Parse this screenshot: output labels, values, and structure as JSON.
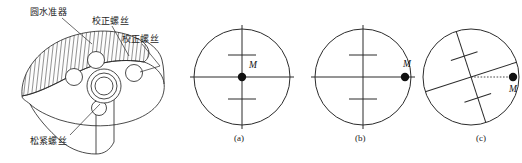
{
  "figure": {
    "background": "#ffffff",
    "stroke": "#2b2b2b"
  },
  "mechanical_drawing": {
    "name": "circular-level-instrument-drawing",
    "callouts": [
      {
        "id": "circular-level",
        "text": "圆水准器",
        "x": 30,
        "y": 7,
        "leader": [
          [
            62,
            18
          ],
          [
            88,
            40
          ]
        ]
      },
      {
        "id": "adjusting-screw-top",
        "text": "校正螺丝",
        "x": 92,
        "y": 15,
        "leader": [
          [
            110,
            26
          ],
          [
            128,
            57
          ]
        ]
      },
      {
        "id": "adjusting-screw-right",
        "text": "校正螺丝",
        "x": 122,
        "y": 33,
        "leader": [
          [
            140,
            44
          ],
          [
            160,
            64
          ]
        ]
      },
      {
        "id": "clamp-screw",
        "text": "松紧螺丝",
        "x": 32,
        "y": 136,
        "leader": [
          [
            68,
            136
          ],
          [
            96,
            104
          ]
        ]
      }
    ]
  },
  "diagrams": [
    {
      "id": "diagram-a",
      "caption": "(a)",
      "caption_x": 236,
      "caption_y": 134,
      "center": {
        "x": 242,
        "y": 77
      },
      "radius": 48,
      "crosshair": {
        "rotation_deg": 0,
        "overhang": 10
      },
      "ticks": [
        {
          "offset": -22
        },
        {
          "offset": 22
        }
      ],
      "bubble": {
        "label": "M",
        "dx": 0,
        "dy": 0,
        "r": 4.2,
        "label_dx": 8,
        "label_dy": -9
      },
      "dotted_line": false
    },
    {
      "id": "diagram-b",
      "caption": "(b)",
      "caption_x": 357,
      "caption_y": 134,
      "center": {
        "x": 363,
        "y": 77
      },
      "radius": 48,
      "crosshair": {
        "rotation_deg": 0,
        "overhang": 10
      },
      "ticks": [
        {
          "offset": -22
        },
        {
          "offset": 22
        }
      ],
      "bubble": {
        "label": "M",
        "dx": 42,
        "dy": 0,
        "r": 4.2,
        "label_dx": 0,
        "label_dy": -10
      },
      "dotted_line": false
    },
    {
      "id": "diagram-c",
      "caption": "(c)",
      "caption_x": 478,
      "caption_y": 134,
      "center": {
        "x": 471,
        "y": 77
      },
      "radius": 48,
      "crosshair": {
        "rotation_deg": -18,
        "overhang": 0
      },
      "ticks": [
        {
          "offset": -22
        },
        {
          "offset": 22
        }
      ],
      "bubble": {
        "label": "M",
        "dx": 42,
        "dy": 0,
        "r": 4.2,
        "label_dx": -2,
        "label_dy": 12
      },
      "dotted_line": true
    }
  ]
}
